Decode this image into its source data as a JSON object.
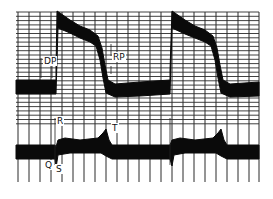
{
  "chart_data": {
    "type": "line",
    "title": "",
    "xlabel": "",
    "ylabel": "",
    "grid": true,
    "legend": "none",
    "series": [
      {
        "name": "pressure",
        "labels": [
          "DP",
          "RP"
        ],
        "top_edge": [
          [
            16,
            80
          ],
          [
            56,
            80
          ],
          [
            56,
            70
          ],
          [
            57,
            11
          ],
          [
            60,
            13
          ],
          [
            70,
            20
          ],
          [
            80,
            26
          ],
          [
            90,
            30
          ],
          [
            98,
            36
          ],
          [
            102,
            48
          ],
          [
            105,
            65
          ],
          [
            108,
            80
          ],
          [
            115,
            84
          ],
          [
            140,
            82
          ],
          [
            170,
            80
          ],
          [
            170,
            70
          ],
          [
            172,
            11
          ],
          [
            175,
            13
          ],
          [
            185,
            20
          ],
          [
            195,
            26
          ],
          [
            205,
            30
          ],
          [
            213,
            36
          ],
          [
            217,
            48
          ],
          [
            220,
            65
          ],
          [
            223,
            80
          ],
          [
            230,
            84
          ],
          [
            259,
            82
          ]
        ],
        "bottom_edge": [
          [
            16,
            94
          ],
          [
            56,
            94
          ],
          [
            58,
            28
          ],
          [
            70,
            33
          ],
          [
            80,
            38
          ],
          [
            90,
            42
          ],
          [
            96,
            46
          ],
          [
            100,
            60
          ],
          [
            103,
            78
          ],
          [
            106,
            93
          ],
          [
            115,
            97
          ],
          [
            140,
            96
          ],
          [
            170,
            94
          ],
          [
            172,
            28
          ],
          [
            185,
            34
          ],
          [
            195,
            38
          ],
          [
            205,
            42
          ],
          [
            211,
            46
          ],
          [
            215,
            60
          ],
          [
            218,
            78
          ],
          [
            221,
            93
          ],
          [
            230,
            97
          ],
          [
            259,
            96
          ]
        ]
      },
      {
        "name": "ecg",
        "labels": [
          "R",
          "Q",
          "S",
          "T"
        ],
        "top_edge": [
          [
            16,
            145
          ],
          [
            55,
            145
          ],
          [
            56,
            147
          ],
          [
            58,
            140
          ],
          [
            65,
            138
          ],
          [
            80,
            140
          ],
          [
            98,
            138
          ],
          [
            103,
            133
          ],
          [
            106,
            129
          ],
          [
            109,
            140
          ],
          [
            112,
            145
          ],
          [
            170,
            145
          ],
          [
            172,
            140
          ],
          [
            180,
            138
          ],
          [
            195,
            140
          ],
          [
            213,
            138
          ],
          [
            218,
            133
          ],
          [
            221,
            129
          ],
          [
            224,
            140
          ],
          [
            227,
            145
          ],
          [
            259,
            145
          ]
        ],
        "bottom_edge": [
          [
            16,
            159
          ],
          [
            55,
            159
          ],
          [
            56,
            168
          ],
          [
            58,
            155
          ],
          [
            70,
            153
          ],
          [
            90,
            153
          ],
          [
            101,
            153
          ],
          [
            106,
            156
          ],
          [
            112,
            159
          ],
          [
            170,
            159
          ],
          [
            172,
            166
          ],
          [
            174,
            155
          ],
          [
            185,
            153
          ],
          [
            205,
            153
          ],
          [
            216,
            153
          ],
          [
            221,
            156
          ],
          [
            227,
            159
          ],
          [
            259,
            159
          ]
        ]
      }
    ],
    "annotations": [
      {
        "text": "DP",
        "x": 44,
        "y": 64
      },
      {
        "text": "RP",
        "x": 113,
        "y": 60
      },
      {
        "text": "R",
        "x": 57,
        "y": 124
      },
      {
        "text": "T",
        "x": 112,
        "y": 131
      },
      {
        "text": "Q",
        "x": 45,
        "y": 168
      },
      {
        "text": "S",
        "x": 56,
        "y": 172
      }
    ],
    "grid_lines": {
      "vertical_x": [
        18,
        29,
        40,
        51,
        62,
        73,
        84,
        95,
        106,
        117,
        128,
        139,
        150,
        161,
        172,
        183,
        194,
        205,
        216,
        227,
        238,
        249,
        259
      ],
      "horizontal_y_start": 12,
      "horizontal_y_end": 125,
      "horizontal_step": 4.3
    }
  }
}
